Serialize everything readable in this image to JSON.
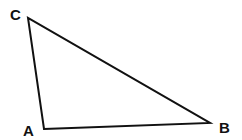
{
  "diagram": {
    "type": "triangle",
    "stroke_color": "#111111",
    "background": "#ffffff",
    "vertices": [
      {
        "name": "A",
        "x": 44,
        "y": 129,
        "label_x": 23,
        "label_y": 136
      },
      {
        "name": "B",
        "x": 210,
        "y": 123,
        "label_x": 219,
        "label_y": 133
      },
      {
        "name": "C",
        "x": 28,
        "y": 18,
        "label_x": 10,
        "label_y": 20
      }
    ],
    "labels": {
      "a": "A",
      "b": "B",
      "c": "C"
    }
  }
}
